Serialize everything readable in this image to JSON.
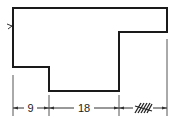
{
  "diagram": {
    "type": "stepped-profile-dimension-drawing",
    "stroke_color": "#1a1a1a",
    "dimension_color": "#333333",
    "dimensions": [
      {
        "id": "dim-left",
        "label": "9"
      },
      {
        "id": "dim-middle",
        "label": "18"
      },
      {
        "id": "dim-right",
        "label": "",
        "note": "hatched-unknown"
      }
    ],
    "marker": {
      "symbol": ">",
      "position": "left-edge"
    }
  }
}
